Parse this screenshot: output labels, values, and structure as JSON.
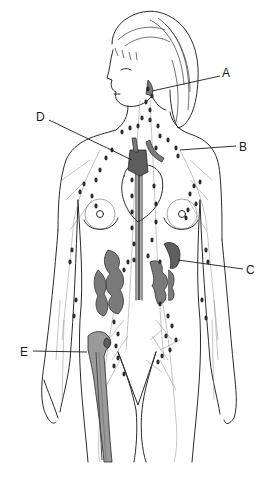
{
  "diagram": {
    "labels": [
      {
        "id": "A",
        "text": "A",
        "points_to": "cervical lymph nodes / tonsil region"
      },
      {
        "id": "B",
        "text": "B",
        "points_to": "axillary / subclavian lymphatic vessels"
      },
      {
        "id": "C",
        "text": "C",
        "points_to": "spleen"
      },
      {
        "id": "D",
        "text": "D",
        "points_to": "thymus"
      },
      {
        "id": "E",
        "text": "E",
        "points_to": "red bone marrow (femur)"
      }
    ]
  }
}
